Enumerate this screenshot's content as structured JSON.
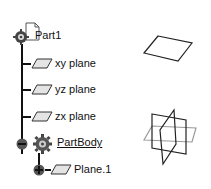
{
  "tree": {
    "root": {
      "label": "Part1",
      "icon": "part-document-icon"
    },
    "items": [
      {
        "label": "xy plane",
        "icon": "plane-icon"
      },
      {
        "label": "yz plane",
        "icon": "plane-icon"
      },
      {
        "label": "zx plane",
        "icon": "plane-icon"
      },
      {
        "label": "PartBody",
        "icon": "body-gear-icon",
        "expander": "collapse",
        "underlined": true
      },
      {
        "label": "Plane.1",
        "icon": "plane-icon",
        "expander": "expand"
      }
    ]
  },
  "viewport": {
    "shapes": [
      "single-plane-preview",
      "three-planes-preview"
    ]
  }
}
